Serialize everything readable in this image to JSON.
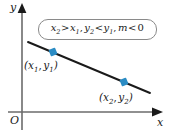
{
  "figure": {
    "type": "coordinate-plane-line-graph",
    "width": 173,
    "height": 136,
    "background": "#ffffff"
  },
  "axes": {
    "x_label": "x",
    "y_label": "y",
    "origin_label": "O",
    "axis_color": "#6b6b6b",
    "x_axis": {
      "x1": 8,
      "y1": 112,
      "x2": 160,
      "y2": 112
    },
    "y_axis": {
      "x1": 22,
      "y1": 128,
      "x2": 22,
      "y2": 6
    }
  },
  "line": {
    "color": "#1a1a1a",
    "x1": 28,
    "y1": 42,
    "x2": 150,
    "y2": 93,
    "slope_sign": "negative"
  },
  "points": [
    {
      "name": "point-1",
      "label_x": "x",
      "label_sub_x": "1",
      "label_y": "y",
      "label_sub_y": "1",
      "marker_color": "#2b8cc4",
      "cx": 53,
      "cy": 52,
      "label_left": 24,
      "label_top": 60
    },
    {
      "name": "point-2",
      "label_x": "x",
      "label_sub_x": "2",
      "label_y": "y",
      "label_sub_y": "2",
      "marker_color": "#2b8cc4",
      "cx": 124,
      "cy": 82,
      "label_left": 99,
      "label_top": 92
    }
  ],
  "condition_box": {
    "border_color": "#8a8a8a",
    "background": "#ffffff",
    "parts": {
      "v1": "x",
      "v1_sub": "2",
      "op1": ">",
      "v2": "x",
      "v2_sub": "1",
      "comma1": ",",
      "v3": "y",
      "v3_sub": "2",
      "op2": "<",
      "v4": "y",
      "v4_sub": "1",
      "comma2": ",",
      "v5": "m",
      "op3": "<",
      "v6": "0"
    },
    "plain_text": "x2 > x1, y2 < y1, m < 0"
  }
}
